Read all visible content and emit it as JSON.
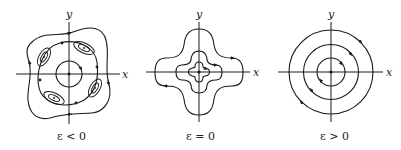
{
  "figure": {
    "panels": [
      {
        "id": "eps-negative",
        "caption": "ε < 0",
        "x_axis_label": "x",
        "y_axis_label": "y",
        "description": "Phase portrait: central center with circular orbit, four saddle points on a tilted separatrix loop, four small elliptical island centers in diagonal positions, outer wavy closed orbit"
      },
      {
        "id": "eps-zero",
        "caption": "ε = 0",
        "x_axis_label": "x",
        "y_axis_label": "y",
        "description": "Phase portrait: nested cross/plus-shaped closed orbits around origin"
      },
      {
        "id": "eps-positive",
        "caption": "ε > 0",
        "x_axis_label": "x",
        "y_axis_label": "y",
        "description": "Phase portrait: three concentric circular closed orbits around origin (center)"
      }
    ],
    "colors": {
      "stroke": "#1a1a1a",
      "background": "#ffffff"
    }
  }
}
